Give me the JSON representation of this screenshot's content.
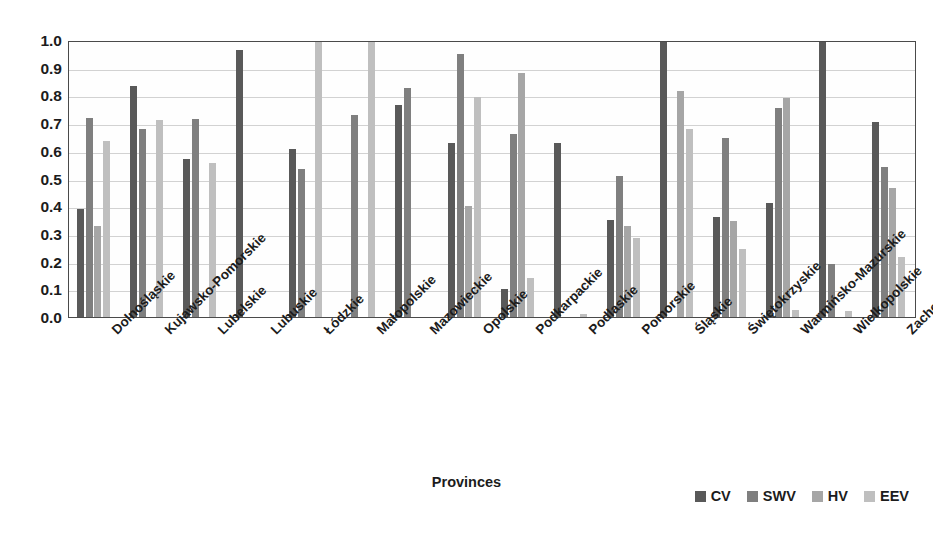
{
  "chart_data": {
    "type": "bar",
    "title": "",
    "xlabel": "Provinces",
    "ylabel": "",
    "ylim": [
      0.0,
      1.0
    ],
    "grid": true,
    "legend_position": "bottom-right",
    "ytick_labels": [
      "1.0",
      "0.9",
      "0.8",
      "0.7",
      "0.6",
      "0.5",
      "0.4",
      "0.3",
      "0.2",
      "0.1",
      "0.0"
    ],
    "ytick_values": [
      1.0,
      0.9,
      0.8,
      0.7,
      0.6,
      0.5,
      0.4,
      0.3,
      0.2,
      0.1,
      0.0
    ],
    "categories": [
      "Dolnośląskie",
      "Kujawsko-Pomorskie",
      "Lubelskie",
      "Lubuskie",
      "Łódzkie",
      "Małopolskie",
      "Mazowieckie",
      "Opolskie",
      "Podkarpackie",
      "Podlaskie",
      "Pomorskie",
      "Śląskie",
      "Świętokrzyskie",
      "Warmińsko-Mazurskie",
      "Wielkopolskie",
      "Zachodniopomorskie"
    ],
    "series": [
      {
        "name": "CV",
        "color": "#595959",
        "values": [
          0.39,
          0.835,
          0.57,
          0.965,
          0.605,
          0.0,
          0.765,
          0.63,
          0.1,
          0.63,
          0.35,
          1.0,
          0.36,
          0.41,
          1.0,
          0.705
        ]
      },
      {
        "name": "SWV",
        "color": "#7f7f7f",
        "values": [
          0.72,
          0.68,
          0.715,
          0.0,
          0.535,
          0.73,
          0.825,
          0.95,
          0.66,
          0.0,
          0.51,
          0.0,
          0.645,
          0.755,
          0.19,
          0.54
        ]
      },
      {
        "name": "HV",
        "color": "#a6a6a6",
        "values": [
          0.33,
          0.0,
          0.0,
          0.0,
          0.0,
          0.0,
          0.0,
          0.4,
          0.88,
          0.0,
          0.33,
          0.815,
          0.345,
          0.79,
          0.0,
          0.465
        ]
      },
      {
        "name": "EEV",
        "color": "#bfbfbf",
        "values": [
          0.635,
          0.71,
          0.555,
          0.0,
          1.0,
          1.0,
          0.0,
          0.795,
          0.14,
          0.01,
          0.285,
          0.68,
          0.245,
          0.025,
          0.02,
          0.215
        ]
      }
    ]
  },
  "legend": {
    "items": [
      {
        "label": "CV",
        "color": "#595959"
      },
      {
        "label": "SWV",
        "color": "#7f7f7f"
      },
      {
        "label": "HV",
        "color": "#a6a6a6"
      },
      {
        "label": "EEV",
        "color": "#bfbfbf"
      }
    ]
  },
  "axis": {
    "x_title": "Provinces"
  }
}
